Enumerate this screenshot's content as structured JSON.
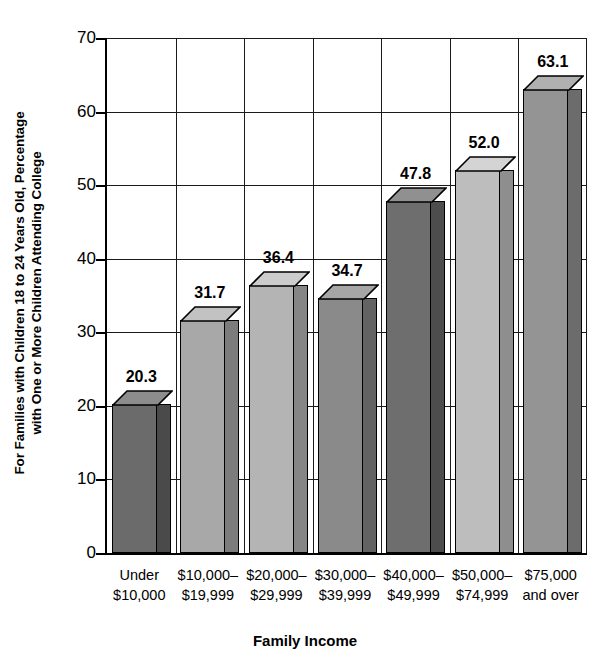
{
  "chart_data": {
    "type": "bar",
    "title": "",
    "xlabel": "Family Income",
    "ylabel": "For Families with Children 18 to 24 Years Old, Percentage with One or More Children Attending College",
    "ylabel_lines": [
      "For Families with Children 18 to 24 Years Old, Percentage",
      "with One or More Children Attending College"
    ],
    "categories": [
      "Under $10,000",
      "$10,000–$19,999",
      "$20,000–$29,999",
      "$30,000–$39,999",
      "$40,000–$49,999",
      "$50,000–$74,999",
      "$75,000 and over"
    ],
    "category_lines": [
      [
        "Under",
        "$10,000"
      ],
      [
        "$10,000–",
        "$19,999"
      ],
      [
        "$20,000–",
        "$29,999"
      ],
      [
        "$30,000–",
        "$39,999"
      ],
      [
        "$40,000–",
        "$49,999"
      ],
      [
        "$50,000–",
        "$74,999"
      ],
      [
        "$75,000",
        "and over"
      ]
    ],
    "values": [
      20.3,
      31.7,
      36.4,
      34.7,
      47.8,
      52.0,
      63.1
    ],
    "value_labels": [
      "20.3",
      "31.7",
      "36.4",
      "34.7",
      "47.8",
      "52.0",
      "63.1"
    ],
    "bar_colors": [
      "#6b6b6b",
      "#a8a8a8",
      "#b4b4b4",
      "#8a8a8a",
      "#6e6e6e",
      "#bdbdbd",
      "#949494"
    ],
    "bar_side_colors": [
      "#4a4a4a",
      "#7c7c7c",
      "#868686",
      "#636363",
      "#4d4d4d",
      "#8e8e8e",
      "#6c6c6c"
    ],
    "bar_top_colors": [
      "#8d8d8d",
      "#c2c2c2",
      "#cccccc",
      "#a6a6a6",
      "#909090",
      "#d4d4d4",
      "#b0b0b0"
    ],
    "ylim": [
      0,
      70
    ],
    "yticks": [
      0,
      10,
      20,
      30,
      40,
      50,
      60,
      70
    ],
    "ytick_labels": [
      "0",
      "10",
      "20",
      "30",
      "40",
      "50",
      "60",
      "70"
    ],
    "grid": "horizontal-and-vertical",
    "legend": "none",
    "axis_color": "#000000",
    "background": "#ffffff"
  }
}
